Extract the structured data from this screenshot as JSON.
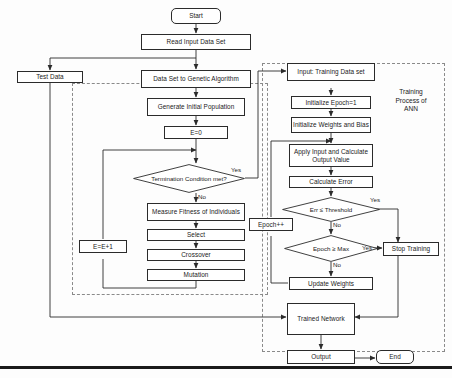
{
  "diagram": {
    "nodes": {
      "start": "Start",
      "read_input": "Read Input Data Set",
      "test_data": "Test Data",
      "dataset_to_ga": "Data Set to Genetic Algorithm",
      "generate_population": "Generate Initial Population",
      "e_zero": "E=0",
      "termination": "Termination Condition met?",
      "measure_fitness": "Measure Fitness of Individuals",
      "select": "Select",
      "crossover": "Crossover",
      "mutation": "Mutation",
      "e_increment": "E=E+1",
      "input_training": "Input: Training Data set",
      "init_epoch": "Initialize Epoch=1",
      "init_weights": "Initialize Weights and Bias",
      "apply_input": "Apply Input and Calculate Output Value",
      "calculate_error": "Calculate Error",
      "err_threshold": "Err ≤ Threshold",
      "epoch_max": "Epoch ≥ Max",
      "epoch_increment": "Epoch++",
      "stop_training": "Stop Training",
      "update_weights": "Update Weights",
      "trained_network": "Trained Network",
      "output": "Output",
      "end": "End"
    },
    "edge_labels": {
      "termination_yes": "Yes",
      "termination_no": "No",
      "err_yes": "Yes",
      "err_no": "No",
      "epoch_yes": "Yes",
      "epoch_no": "No"
    },
    "groups": {
      "ann_label": "Training\nProcess of\nANN"
    },
    "colors": {
      "stroke": "#2b2b2b",
      "dashed_stroke": "#8a8a8a",
      "text": "#1a1a1a",
      "background": "#fdfdfd"
    }
  }
}
